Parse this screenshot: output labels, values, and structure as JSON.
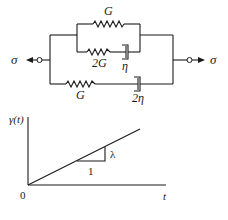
{
  "circuit": {
    "left_load_label": "σ",
    "right_load_label": "σ",
    "upper_branch": {
      "top_spring_label": "G",
      "lower_spring_label": "2G",
      "lower_dashpot_label": "η"
    },
    "lower_branch": {
      "spring_label": "G",
      "dashpot_label": "2η"
    }
  },
  "graph": {
    "y_axis_label": "γ(t)",
    "x_axis_label": "t",
    "origin_label": "0",
    "slope_run_label": "1",
    "slope_rise_label": "λ"
  },
  "colors": {
    "ink": "#1a1a1a",
    "background": "#ffffff"
  }
}
